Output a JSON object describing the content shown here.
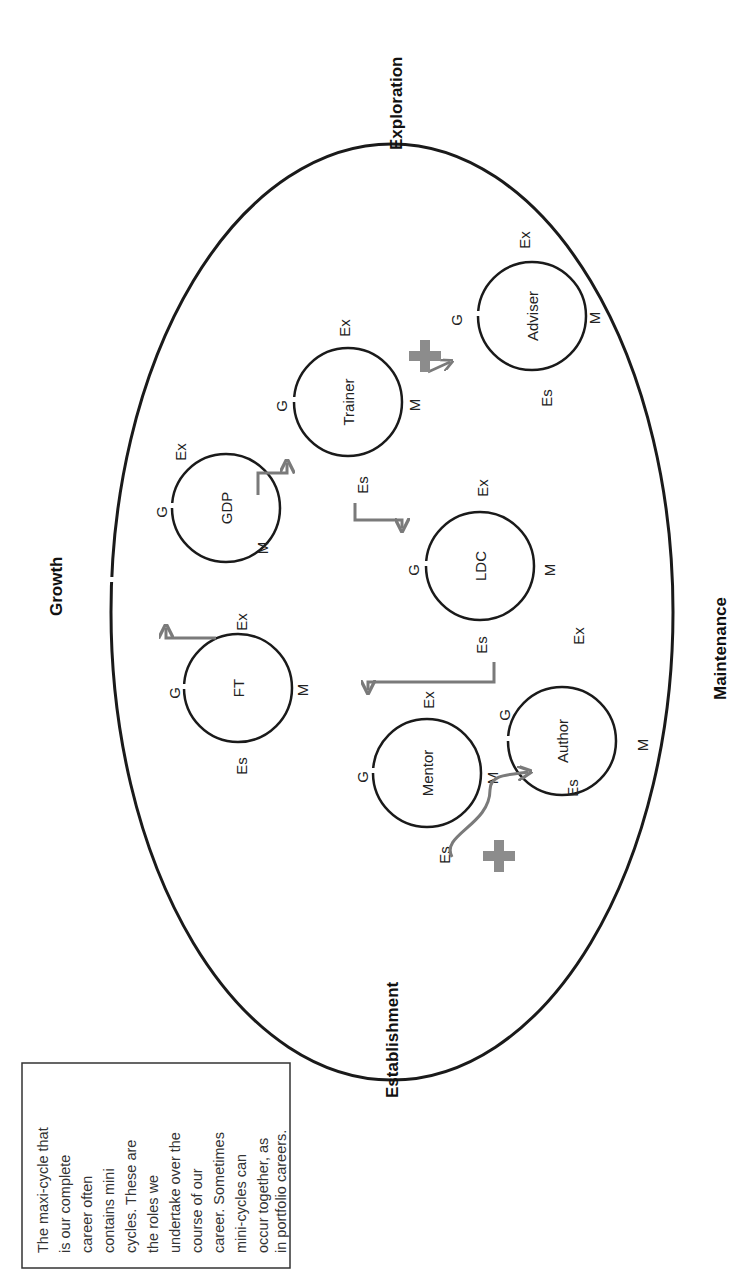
{
  "diagram": {
    "orientation": "rotated 90 degrees counter-clockwise",
    "stages": {
      "exploration": "Exploration",
      "growth": "Growth",
      "maintenance": "Maintenance",
      "establishment": "Establishment"
    },
    "phase_abbreviations": {
      "growth": "G",
      "exploration": "Ex",
      "maintenance": "M",
      "establishment": "Es"
    },
    "roles": [
      {
        "id": "ft",
        "label": "FT"
      },
      {
        "id": "gdp",
        "label": "GDP"
      },
      {
        "id": "trainer",
        "label": "Trainer"
      },
      {
        "id": "ldc",
        "label": "LDC"
      },
      {
        "id": "mentor",
        "label": "Mentor"
      },
      {
        "id": "author",
        "label": "Author"
      },
      {
        "id": "adviser",
        "label": "Adviser"
      }
    ],
    "transitions": [
      {
        "from": "FT (Ex)",
        "to": "GDP (G)"
      },
      {
        "from": "GDP (M)",
        "to": "Trainer (G)"
      },
      {
        "from": "Trainer (Es)",
        "to": "LDC (G)"
      },
      {
        "from": "LDC (Es)",
        "to": "Mentor (Ex)"
      },
      {
        "from": "Trainer (M)",
        "to": "Adviser (G)",
        "concurrent": true
      },
      {
        "from": "Mentor (Es)",
        "to": "Author (G)",
        "concurrent": true
      }
    ],
    "note": {
      "lines": [
        "The maxi-cycle that",
        "is our complete",
        "career often",
        "contains mini",
        "cycles. These are",
        "the roles we",
        "undertake over the",
        "course of our",
        "career. Sometimes",
        "mini-cycles can",
        "occur together, as",
        "in portfolio careers."
      ]
    },
    "colors": {
      "outline": "#1a1a1a",
      "arrow": "#7a7a7a",
      "plus": "#8c8c8c",
      "text": "#222222"
    }
  }
}
